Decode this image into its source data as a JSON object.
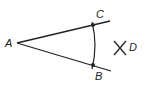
{
  "diagram": {
    "type": "geometric-construction",
    "colors": {
      "stroke": "#222222",
      "background": "#ffffff"
    },
    "points": [
      {
        "id": "A",
        "label": "A",
        "x": 17,
        "y": 43
      },
      {
        "id": "C",
        "label": "C",
        "x": 93,
        "y": 24
      },
      {
        "id": "B",
        "label": "B",
        "x": 93,
        "y": 65
      },
      {
        "id": "D",
        "label": "D",
        "x": 120,
        "y": 48
      }
    ],
    "segments": [
      {
        "from": "A",
        "to": "ray-C-end",
        "description": "ray from A through C"
      },
      {
        "from": "A",
        "to": "ray-B-end",
        "description": "ray from A through B"
      }
    ],
    "arc": {
      "from": "C",
      "to": "B",
      "description": "arc centered at A intersecting both rays"
    },
    "marks": [
      {
        "at": "D",
        "shape": "X",
        "description": "intersection of construction arcs"
      }
    ]
  }
}
